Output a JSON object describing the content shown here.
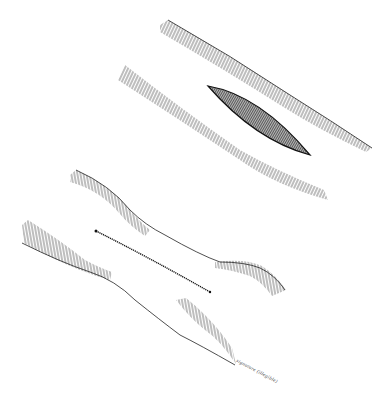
{
  "image": {
    "description": "Pen-and-ink illustration: upper vessel segment with elliptical incision opening; lower vessel segment narrowed with linear sutured closure",
    "background": "#ffffff",
    "ink": "#1a1a1a"
  },
  "figures": [
    {
      "name": "upper-vessel",
      "feature": "elliptical incision"
    },
    {
      "name": "lower-vessel",
      "feature": "linear closure narrowing lumen"
    }
  ],
  "signature": {
    "text": "signature (illegible)"
  }
}
